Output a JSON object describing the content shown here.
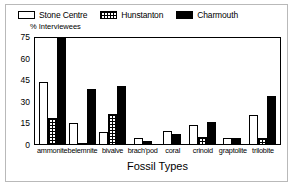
{
  "figure": {
    "frame_color": "#b9b9b9",
    "background": "#ffffff"
  },
  "legend": {
    "entries": [
      {
        "label": "Stone Centre",
        "swatch": "open-white-bar-icon",
        "color": "#ffffff"
      },
      {
        "label": "Hunstanton",
        "swatch": "grid-hatched-bar-icon",
        "color": "#ffffff"
      },
      {
        "label": "Charmouth",
        "swatch": "solid-black-bar-icon",
        "color": "#000000"
      }
    ]
  },
  "axes": {
    "ylabel": "% Interviewees",
    "xtitle": "Fossil Types",
    "yticks": [
      0,
      15,
      30,
      45,
      60,
      75
    ]
  },
  "chart_data": {
    "type": "bar",
    "title": "",
    "subtitle": "",
    "xlabel": "Fossil Types",
    "ylabel": "% Interviewees",
    "ylim": [
      0,
      75
    ],
    "ytick_labels": [
      "0",
      "15",
      "30",
      "45",
      "60",
      "75"
    ],
    "grid": false,
    "legend_position": "top",
    "categories": [
      "ammonite",
      "belemnite",
      "bivalve",
      "brach'pod",
      "coral",
      "crinoid",
      "graptolite",
      "trilobite"
    ],
    "series": [
      {
        "name": "Stone Centre",
        "fill": "open-white",
        "values": [
          43,
          14.5,
          8,
          4,
          9,
          13,
          4,
          20
        ]
      },
      {
        "name": "Hunstanton",
        "fill": "grid-hatched",
        "values": [
          18,
          1,
          21,
          0,
          0,
          5,
          0,
          4
        ]
      },
      {
        "name": "Charmouth",
        "fill": "solid-black",
        "values": [
          74,
          38,
          40,
          2,
          7,
          15.5,
          4,
          33
        ]
      }
    ]
  }
}
